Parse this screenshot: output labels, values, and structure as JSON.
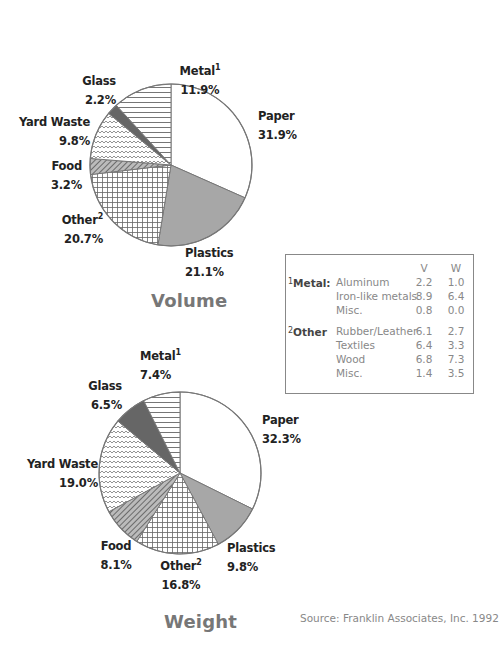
{
  "chart_data": [
    {
      "type": "pie",
      "title": "Volume",
      "start_angle_deg": 0,
      "direction": "clockwise",
      "categories": [
        "Paper",
        "Plastics",
        "Other",
        "Food",
        "Yard Waste",
        "Glass",
        "Metal"
      ],
      "values": [
        31.9,
        21.1,
        20.7,
        3.2,
        9.8,
        2.2,
        11.9
      ],
      "labels": [
        {
          "name": "Paper",
          "value": "31.9%"
        },
        {
          "name": "Plastics",
          "value": "21.1%"
        },
        {
          "name": "Other",
          "sup": "2",
          "value": "20.7%"
        },
        {
          "name": "Food",
          "value": "3.2%"
        },
        {
          "name": "Yard Waste",
          "value": "9.8%"
        },
        {
          "name": "Glass",
          "value": "2.2%"
        },
        {
          "name": "Metal",
          "sup": "1",
          "value": "11.9%"
        }
      ]
    },
    {
      "type": "pie",
      "title": "Weight",
      "start_angle_deg": 0,
      "direction": "clockwise",
      "categories": [
        "Paper",
        "Plastics",
        "Other",
        "Food",
        "Yard Waste",
        "Glass",
        "Metal"
      ],
      "values": [
        32.3,
        9.8,
        16.8,
        8.1,
        19.0,
        6.5,
        7.4
      ],
      "labels": [
        {
          "name": "Paper",
          "value": "32.3%"
        },
        {
          "name": "Plastics",
          "value": "9.8%"
        },
        {
          "name": "Other",
          "sup": "2",
          "value": "16.8%"
        },
        {
          "name": "Food",
          "value": "8.1%"
        },
        {
          "name": "Yard Waste",
          "value": "19.0%"
        },
        {
          "name": "Glass",
          "value": "6.5%"
        },
        {
          "name": "Metal",
          "sup": "1",
          "value": "7.4%"
        }
      ]
    },
    {
      "type": "table",
      "title": "Breakdown of Metal and Other",
      "columns": [
        "",
        "",
        "V",
        "W"
      ],
      "groups": [
        {
          "marker": "1",
          "name": "Metal:",
          "rows": [
            {
              "item": "Aluminum",
              "V": "2.2",
              "W": "1.0"
            },
            {
              "item": "Iron-like metals",
              "V": "8.9",
              "W": "6.4"
            },
            {
              "item": "Misc.",
              "V": "0.8",
              "W": "0.0"
            }
          ]
        },
        {
          "marker": "2",
          "name": "Other",
          "rows": [
            {
              "item": "Rubber/Leather",
              "V": "6.1",
              "W": "2.7"
            },
            {
              "item": "Textiles",
              "V": "6.4",
              "W": "3.3"
            },
            {
              "item": "Wood",
              "V": "6.8",
              "W": "7.3"
            },
            {
              "item": "Misc.",
              "V": "1.4",
              "W": "3.5"
            }
          ]
        }
      ]
    }
  ],
  "volume": {
    "title": "Volume",
    "paper": {
      "name": "Paper",
      "value": "31.9%"
    },
    "plastics": {
      "name": "Plastics",
      "value": "21.1%"
    },
    "other": {
      "name": "Other",
      "sup": "2",
      "value": "20.7%"
    },
    "food": {
      "name": "Food",
      "value": "3.2%"
    },
    "yard": {
      "name": "Yard Waste",
      "value": "9.8%"
    },
    "glass": {
      "name": "Glass",
      "value": "2.2%"
    },
    "metal": {
      "name": "Metal",
      "sup": "1",
      "value": "11.9%"
    }
  },
  "weight": {
    "title": "Weight",
    "paper": {
      "name": "Paper",
      "value": "32.3%"
    },
    "plastics": {
      "name": "Plastics",
      "value": "9.8%"
    },
    "other": {
      "name": "Other",
      "sup": "2",
      "value": "16.8%"
    },
    "food": {
      "name": "Food",
      "value": "8.1%"
    },
    "yard": {
      "name": "Yard Waste",
      "value": "19.0%"
    },
    "glass": {
      "name": "Glass",
      "value": "6.5%"
    },
    "metal": {
      "name": "Metal",
      "sup": "1",
      "value": "7.4%"
    }
  },
  "breakdown": {
    "col_v": "V",
    "col_w": "W",
    "metal": {
      "marker": "1",
      "name": "Metal:",
      "rows": [
        {
          "item": "Aluminum",
          "v": "2.2",
          "w": "1.0"
        },
        {
          "item": "Iron-like metals",
          "v": "8.9",
          "w": "6.4"
        },
        {
          "item": "Misc.",
          "v": "0.8",
          "w": "0.0"
        }
      ]
    },
    "other": {
      "marker": "2",
      "name": "Other",
      "rows": [
        {
          "item": "Rubber/Leather",
          "v": "6.1",
          "w": "2.7"
        },
        {
          "item": "Textiles",
          "v": "6.4",
          "w": "3.3"
        },
        {
          "item": "Wood",
          "v": "6.8",
          "w": "7.3"
        },
        {
          "item": "Misc.",
          "v": "1.4",
          "w": "3.5"
        }
      ]
    }
  },
  "source": "Source: Franklin Associates, Inc. 1992",
  "colors": {
    "outline": "#777777",
    "paper": "#ffffff",
    "plastics": "#aaaaaa",
    "glass": "#666666",
    "title": "#777777",
    "table_text": "#888888"
  }
}
